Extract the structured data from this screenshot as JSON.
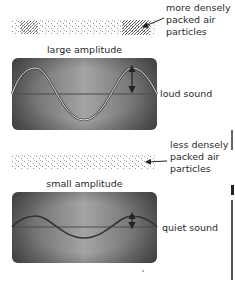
{
  "diagram": {
    "top": {
      "particles_label": [
        "more densely",
        "packed air",
        "particles"
      ],
      "amplitude_caption": "large amplitude",
      "sound_label": "loud sound",
      "amplitude_px": 26
    },
    "bottom": {
      "particles_label": [
        "less densely",
        "packed air",
        "particles"
      ],
      "amplitude_caption": "small amplitude",
      "sound_label": "quiet sound",
      "amplitude_px": 11
    },
    "colors": {
      "panel_dark": "#5a5a5a",
      "panel_light": "#9a9a9a",
      "wave": "#e8e8e8",
      "centerline": "#4a4a4a",
      "text": "#2a2a2a"
    }
  }
}
